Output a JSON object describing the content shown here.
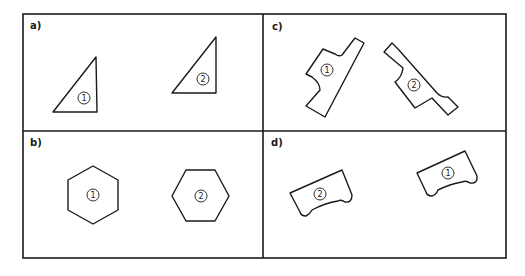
{
  "figure": {
    "panels": [
      {
        "id": "a",
        "label": "a)",
        "shape": "right-triangle",
        "items": [
          {
            "marker": "1"
          },
          {
            "marker": "2"
          }
        ]
      },
      {
        "id": "b",
        "label": "b)",
        "shape": "hexagon",
        "items": [
          {
            "marker": "1"
          },
          {
            "marker": "2"
          }
        ]
      },
      {
        "id": "c",
        "label": "c)",
        "shape": "notched-bar",
        "items": [
          {
            "marker": "1"
          },
          {
            "marker": "2"
          }
        ]
      },
      {
        "id": "d",
        "label": "d)",
        "shape": "scalloped-block",
        "items": [
          {
            "marker": "2"
          },
          {
            "marker": "1"
          }
        ]
      }
    ]
  },
  "colors": {
    "stroke": "#1a1a1a",
    "background": "#ffffff"
  }
}
